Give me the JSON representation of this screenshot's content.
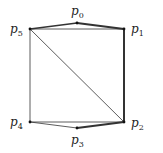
{
  "figure": {
    "type": "polygon-triangulation",
    "points": [
      {
        "id": "p0",
        "label": "p",
        "sub": "0",
        "x": 77,
        "y": 23,
        "lx": 71,
        "ly": 15
      },
      {
        "id": "p1",
        "label": "p",
        "sub": "1",
        "x": 124,
        "y": 29,
        "lx": 131,
        "ly": 33
      },
      {
        "id": "p2",
        "label": "p",
        "sub": "2",
        "x": 124,
        "y": 122,
        "lx": 131,
        "ly": 127
      },
      {
        "id": "p3",
        "label": "p",
        "sub": "3",
        "x": 77,
        "y": 128,
        "lx": 71,
        "ly": 144
      },
      {
        "id": "p4",
        "label": "p",
        "sub": "4",
        "x": 30,
        "y": 122,
        "lx": 10,
        "ly": 126
      },
      {
        "id": "p5",
        "label": "p",
        "sub": "5",
        "x": 30,
        "y": 29,
        "lx": 10,
        "ly": 33
      }
    ],
    "edges": [
      {
        "from": "p5",
        "to": "p0",
        "weight": "medium"
      },
      {
        "from": "p0",
        "to": "p1",
        "weight": "bold"
      },
      {
        "from": "p1",
        "to": "p2",
        "weight": "bold"
      },
      {
        "from": "p2",
        "to": "p3",
        "weight": "bold"
      },
      {
        "from": "p3",
        "to": "p4",
        "weight": "thin"
      },
      {
        "from": "p4",
        "to": "p5",
        "weight": "thin"
      },
      {
        "from": "p5",
        "to": "p1",
        "weight": "thin"
      },
      {
        "from": "p5",
        "to": "p2",
        "weight": "thin"
      },
      {
        "from": "p4",
        "to": "p2",
        "weight": "thin"
      }
    ],
    "colors": {
      "line": "#333333",
      "vertex": "#111111",
      "label": "#222222"
    },
    "weights": {
      "thin": 0.8,
      "medium": 1.3,
      "bold": 2.0
    }
  }
}
